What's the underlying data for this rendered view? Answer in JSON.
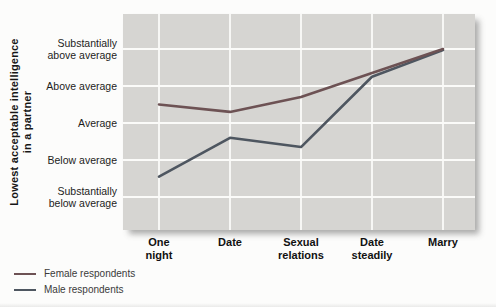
{
  "chart_data": {
    "type": "line",
    "title": "",
    "ylabel": "Lowest acceptable intelligence in a partner",
    "ylabel_line1": "Lowest acceptable intelligence",
    "ylabel_line2": "in a partner",
    "categories": [
      "One night",
      "Date",
      "Sexual relations",
      "Date steadily",
      "Marry"
    ],
    "x_ticks": [
      {
        "line1": "One",
        "line2": "night"
      },
      {
        "line1": "Date",
        "line2": ""
      },
      {
        "line1": "Sexual",
        "line2": "relations"
      },
      {
        "line1": "Date",
        "line2": "steadily"
      },
      {
        "line1": "Marry",
        "line2": ""
      }
    ],
    "y_ticks": [
      {
        "value": 5,
        "line1": "Substantially",
        "line2": "above average"
      },
      {
        "value": 4,
        "line1": "Above average",
        "line2": ""
      },
      {
        "value": 3,
        "line1": "Average",
        "line2": ""
      },
      {
        "value": 2,
        "line1": "Below average",
        "line2": ""
      },
      {
        "value": 1,
        "line1": "Substantially",
        "line2": "below average"
      }
    ],
    "ylim": [
      1,
      5
    ],
    "y_scale_note": "1 = Substantially below average, 5 = Substantially above average",
    "grid": true,
    "gridline_color": "#fbfbf9",
    "plot_bg": "#d6d5d2",
    "legend_position": "bottom-left",
    "series": [
      {
        "name": "Female respondents",
        "color": "#6d5254",
        "values": [
          3.5,
          3.3,
          3.7,
          4.35,
          5.0
        ]
      },
      {
        "name": "Male respondents",
        "color": "#4e5660",
        "values": [
          1.55,
          2.6,
          2.35,
          4.25,
          4.97
        ]
      }
    ]
  }
}
